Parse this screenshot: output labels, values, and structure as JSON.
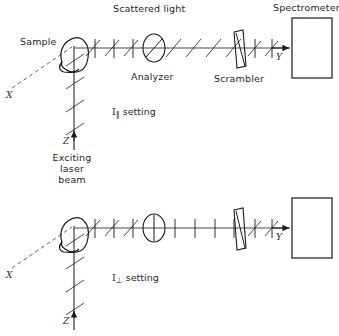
{
  "figure": {
    "colors": {
      "line": "#1a1a1a",
      "text": "#1f1f1f",
      "background": "#ffffff",
      "beam": "#4a4a4a",
      "dashed_axis": "#555555"
    },
    "panels": [
      {
        "id": "parallel",
        "setting_label": "setting",
        "setting_symbol": "I",
        "setting_subscript": "∥",
        "analyzer_orientation": "diagonal",
        "labels": {
          "sample": "Sample",
          "scattered_light": "Scattered light",
          "analyzer": "Analyzer",
          "scrambler": "Scrambler",
          "spectrometer": "Spectrometer",
          "axis_x": "X",
          "axis_y": "Y",
          "axis_z": "Z",
          "source_line1": "Exciting",
          "source_line2": "laser",
          "source_line3": "beam"
        }
      },
      {
        "id": "perpendicular",
        "setting_label": "setting",
        "setting_symbol": "I",
        "setting_subscript": "⊥",
        "analyzer_orientation": "vertical",
        "labels": {
          "axis_x": "X",
          "axis_y": "Y",
          "axis_z": "Z"
        }
      }
    ]
  }
}
